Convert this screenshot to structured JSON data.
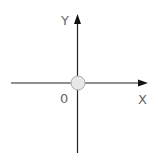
{
  "diagram": {
    "type": "coordinate-axes",
    "labels": {
      "y_axis": "Y",
      "x_axis": "X",
      "origin": "0"
    },
    "colors": {
      "axis": "#222222",
      "origin_fill": "#e8e8e8",
      "origin_stroke": "#aaaaaa",
      "label": "#666666"
    }
  }
}
